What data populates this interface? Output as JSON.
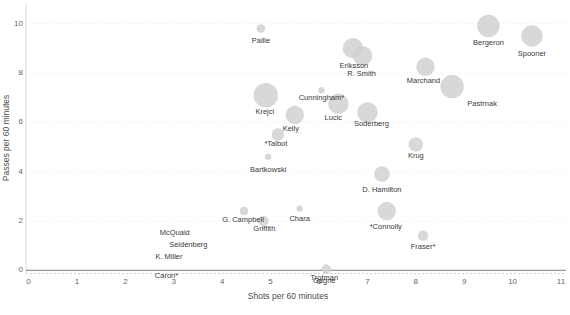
{
  "chart_data": {
    "type": "scatter",
    "title": "",
    "xlabel": "Shots per 60 minutes",
    "ylabel": "Passes per 60 minutes",
    "xlim": [
      0,
      11.2
    ],
    "ylim": [
      -0.6,
      10.6
    ],
    "x_ticks": [
      0,
      1,
      2,
      3,
      4,
      5,
      6,
      7,
      8,
      9,
      10,
      11
    ],
    "y_ticks": [
      0,
      2,
      4,
      6,
      8,
      10
    ],
    "grid": "faint dotted horizontal gridlines, solid reference line at y=0",
    "legend": "none",
    "bubble_color": "#d1d1d1",
    "label_color": "#3a3a3a",
    "axis_text_color": "#666666",
    "zero_line_color": "#7f7f7f",
    "points": [
      {
        "label": "Paille",
        "x": 4.8,
        "y": 9.8,
        "r": 4,
        "dx": 0,
        "dy": 12
      },
      {
        "label": "Bergeron",
        "x": 9.5,
        "y": 9.9,
        "r": 11,
        "dx": 0,
        "dy": 17
      },
      {
        "label": "Spooner",
        "x": 10.4,
        "y": 9.5,
        "r": 10.5,
        "dx": 0,
        "dy": 18
      },
      {
        "label": "Eriksson",
        "x": 6.7,
        "y": 9.0,
        "r": 10,
        "dx": 1,
        "dy": 18
      },
      {
        "label": "R. Smith",
        "x": 6.9,
        "y": 8.7,
        "r": 9.5,
        "dx": -1,
        "dy": 18
      },
      {
        "label": "Marchand",
        "x": 8.2,
        "y": 8.25,
        "r": 9,
        "dx": -2,
        "dy": 14
      },
      {
        "label": "Pastrnak",
        "x": 8.75,
        "y": 7.45,
        "r": 11.5,
        "dx": 30,
        "dy": 18
      },
      {
        "label": "Cunningham*",
        "x": 6.05,
        "y": 7.3,
        "r": 3,
        "dx": 0,
        "dy": 8
      },
      {
        "label": "Krejci",
        "x": 4.9,
        "y": 7.1,
        "r": 12,
        "dx": -1,
        "dy": 17
      },
      {
        "label": "Lucic",
        "x": 6.4,
        "y": 6.75,
        "r": 10,
        "dx": -5,
        "dy": 14
      },
      {
        "label": "Soderberg",
        "x": 7.0,
        "y": 6.4,
        "r": 10,
        "dx": 4,
        "dy": 12
      },
      {
        "label": "Kelly",
        "x": 5.5,
        "y": 6.3,
        "r": 9,
        "dx": -4,
        "dy": 14
      },
      {
        "label": "*Talbot",
        "x": 5.15,
        "y": 5.5,
        "r": 6,
        "dx": -2,
        "dy": 9
      },
      {
        "label": "Krug",
        "x": 8.0,
        "y": 5.1,
        "r": 7,
        "dx": 0,
        "dy": 12
      },
      {
        "label": "Bartkowski",
        "x": 4.95,
        "y": 4.6,
        "r": 3,
        "dx": 0,
        "dy": 13
      },
      {
        "label": "D. Hamilton",
        "x": 7.3,
        "y": 3.9,
        "r": 7.5,
        "dx": 0,
        "dy": 16
      },
      {
        "label": "G. Campbell",
        "x": 4.45,
        "y": 2.4,
        "r": 4,
        "dx": -1,
        "dy": 9
      },
      {
        "label": "Chara",
        "x": 5.6,
        "y": 2.5,
        "r": 3,
        "dx": 0,
        "dy": 10
      },
      {
        "label": "Griffith",
        "x": 4.85,
        "y": 2.0,
        "r": 5,
        "dx": 1,
        "dy": 8
      },
      {
        "label": "*Connolly",
        "x": 7.4,
        "y": 2.4,
        "r": 9,
        "dx": -1,
        "dy": 16
      },
      {
        "label": "Fraser*",
        "x": 8.15,
        "y": 1.4,
        "r": 5,
        "dx": 0,
        "dy": 11
      },
      {
        "label": "McQuaid",
        "x": 3.0,
        "y": 1.7,
        "r": 0,
        "dx": 1,
        "dy": 5
      },
      {
        "label": "Seidenberg",
        "x": 3.3,
        "y": 1.3,
        "r": 0,
        "dx": 0,
        "dy": 7
      },
      {
        "label": "K. Miller",
        "x": 2.9,
        "y": 0.8,
        "r": 0,
        "dx": 0,
        "dy": 6
      },
      {
        "label": "Caron*",
        "x": 2.85,
        "y": 0.0,
        "r": 0,
        "dx": 0,
        "dy": 6
      },
      {
        "label": "Trotman",
        "x": 6.15,
        "y": 0.05,
        "r": 4.5,
        "dx": -2,
        "dy": 9
      },
      {
        "label": "Gagne",
        "x": 6.15,
        "y": 0.0,
        "r": 0,
        "dx": -2,
        "dy": 11
      }
    ]
  }
}
